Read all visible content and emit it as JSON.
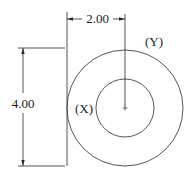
{
  "diagram": {
    "type": "engineering-drawing",
    "colors": {
      "line": "#2a2a2a",
      "text": "#1a1a1a",
      "background": "#ffffff"
    },
    "dimensions": {
      "horizontal": {
        "label": "2.00"
      },
      "vertical": {
        "label": "4.00"
      }
    },
    "callouts": {
      "outer_circle": "(Y)",
      "inner_circle": "(X)"
    },
    "center_mark": "+"
  }
}
